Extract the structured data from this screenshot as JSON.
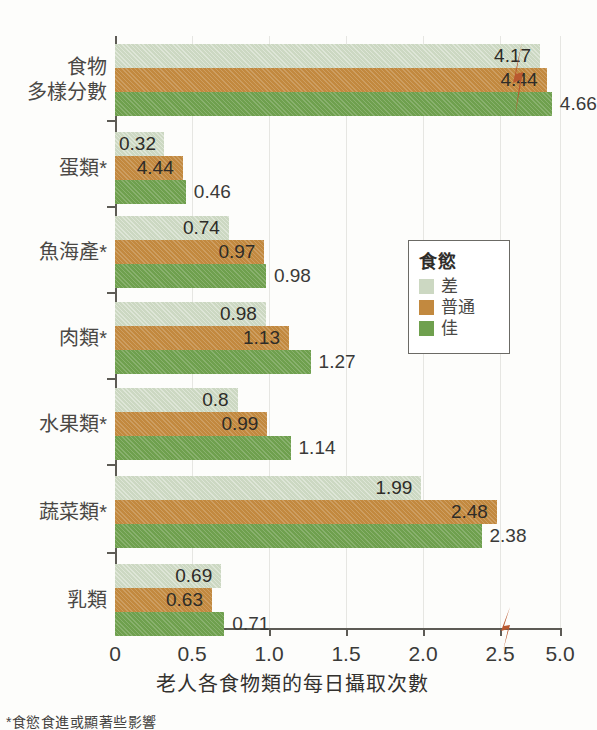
{
  "chart_data": {
    "type": "bar",
    "orientation": "horizontal",
    "title": "",
    "xlabel": "老人各食物類的每日攝取次數",
    "ylabel": "",
    "categories": [
      "食物\n多樣分數",
      "蛋類*",
      "魚海產*",
      "肉類*",
      "水果類*",
      "蔬菜類*",
      "乳類"
    ],
    "category_lines": [
      [
        "食物",
        "多樣分數"
      ],
      [
        "蛋類*"
      ],
      [
        "魚海產*"
      ],
      [
        "肉類*"
      ],
      [
        "水果類*"
      ],
      [
        "蔬菜類*"
      ],
      [
        "乳類"
      ]
    ],
    "series": [
      {
        "name": "差",
        "color": "#ccd8c2",
        "values": [
          4.17,
          0.32,
          0.74,
          0.98,
          0.8,
          1.99,
          0.69
        ]
      },
      {
        "name": "普通",
        "color": "#c2893f",
        "values": [
          4.44,
          0.44,
          0.97,
          1.13,
          0.99,
          2.48,
          0.63
        ]
      },
      {
        "name": "佳",
        "color": "#6fa04e",
        "values": [
          4.66,
          0.46,
          0.98,
          1.27,
          1.14,
          2.38,
          0.71
        ]
      }
    ],
    "value_labels": [
      [
        "4.17",
        "4.44",
        "4.66"
      ],
      [
        "0.32",
        "4.44",
        "0.46"
      ],
      [
        "0.74",
        "0.97",
        "0.98"
      ],
      [
        "0.98",
        "1.13",
        "1.27"
      ],
      [
        "0.8",
        "0.99",
        "1.14"
      ],
      [
        "1.99",
        "2.48",
        "2.38"
      ],
      [
        "0.69",
        "0.63",
        "0.71"
      ]
    ],
    "xticks": [
      0,
      0.5,
      1.0,
      1.5,
      2.0,
      2.5,
      5.0
    ],
    "xtick_labels": [
      "0",
      "0.5",
      "1.0",
      "1.5",
      "2.0",
      "2.5",
      "5.0"
    ],
    "xlim": [
      0,
      5.0
    ],
    "axis_break": {
      "present": true,
      "between": [
        2.5,
        5.0
      ],
      "color": "#b9582f"
    },
    "grid": "vertical",
    "legend": {
      "title": "食慾",
      "position": "right-middle",
      "entries": [
        {
          "label": "差",
          "color": "#ccd8c2"
        },
        {
          "label": "普通",
          "color": "#c2893f"
        },
        {
          "label": "佳",
          "color": "#6fa04e"
        }
      ]
    },
    "footnote": "*食慾食進或顯著些影響"
  }
}
